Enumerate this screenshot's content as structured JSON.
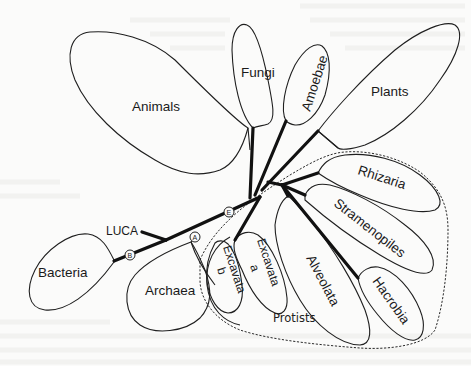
{
  "diagram": {
    "groups": {
      "animals": "Animals",
      "fungi": "Fungi",
      "amoebae": "Amoebae",
      "plants": "Plants",
      "rhizaria": "Rhizaria",
      "stramenopiles": "Stramenopiles",
      "hacrobia": "Hacrobia",
      "alveolata": "Alveolata",
      "excavata_a_line1": "Excavata",
      "excavata_a_line2": "a",
      "excavata_b_line1": "Excavata",
      "excavata_b_line2": "b",
      "archaea": "Archaea",
      "bacteria": "Bacteria"
    },
    "root_label": "LUCA",
    "enclosure_label": "Protists",
    "markers": {
      "bacteria_node": "B",
      "archaea_node": "A",
      "eukaryote_node": "E"
    },
    "colors": {
      "background": "#fbfbfa",
      "stroke": "#1f1f1f",
      "branch": "#111111"
    }
  }
}
